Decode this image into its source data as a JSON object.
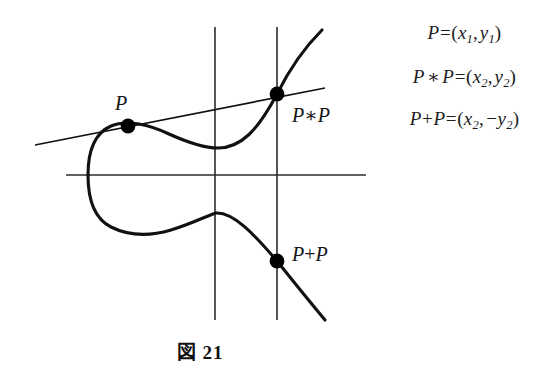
{
  "figure": {
    "caption": "図 21",
    "caption_label": "図",
    "caption_number": "21",
    "colors": {
      "curve": "#111111",
      "axes": "#2b2b2b",
      "tangent": "#111111",
      "point": "#000000",
      "text": "#1b1b1b",
      "background": "#ffffff"
    }
  },
  "point_labels": [
    {
      "id": "p",
      "text": "P",
      "x": 115,
      "y": 92
    },
    {
      "id": "p-star-p",
      "text": "P∗P",
      "x": 292,
      "y": 103
    },
    {
      "id": "p-plus-p",
      "text": "P+P",
      "x": 292,
      "y": 243
    }
  ],
  "equations": [
    {
      "id": "eq-p",
      "text": "P=(x1, y1)"
    },
    {
      "id": "eq-p-star-p",
      "text": "P∗P=(x2, y2)"
    },
    {
      "id": "eq-p-plus-p",
      "text": "P+P=(x2, −y2)"
    }
  ],
  "chart_data": {
    "type": "line",
    "title": "図 21",
    "xlabel": "",
    "ylabel": "",
    "axes": {
      "horizontal": {
        "y": 175,
        "x_start": 66,
        "x_end": 366
      },
      "verticals": [
        {
          "x": 215,
          "y_start": 27,
          "y_end": 320
        },
        {
          "x": 277,
          "y_start": 27,
          "y_end": 320
        }
      ],
      "grid": false,
      "legend": false
    },
    "points": [
      {
        "name": "P",
        "px": 128,
        "py": 126,
        "label": "P=(x1, y1)"
      },
      {
        "name": "P∗P",
        "px": 277,
        "py": 94,
        "label": "P∗P=(x2, y2)"
      },
      {
        "name": "P+P",
        "px": 277,
        "py": 261,
        "label": "P+P=(x2, −y2)"
      }
    ],
    "tangent_line": {
      "x1": 35,
      "y1": 145,
      "x2": 325,
      "y2": 88
    },
    "series": [
      {
        "name": "elliptic-curve-upper",
        "path": "M 88 175 C 88 150 96 132 112 126 C 128 120 152 126 170 134 C 190 143 205 148 218 148 C 240 148 258 132 277 94 C 290 68 306 45 322 31"
      },
      {
        "name": "elliptic-curve-lower",
        "path": "M 88 175 C 88 200 96 220 112 228 C 130 237 152 236 172 230 C 195 223 207 216 216 213 C 232 212 252 232 277 261 C 293 280 310 302 325 320"
      }
    ]
  }
}
